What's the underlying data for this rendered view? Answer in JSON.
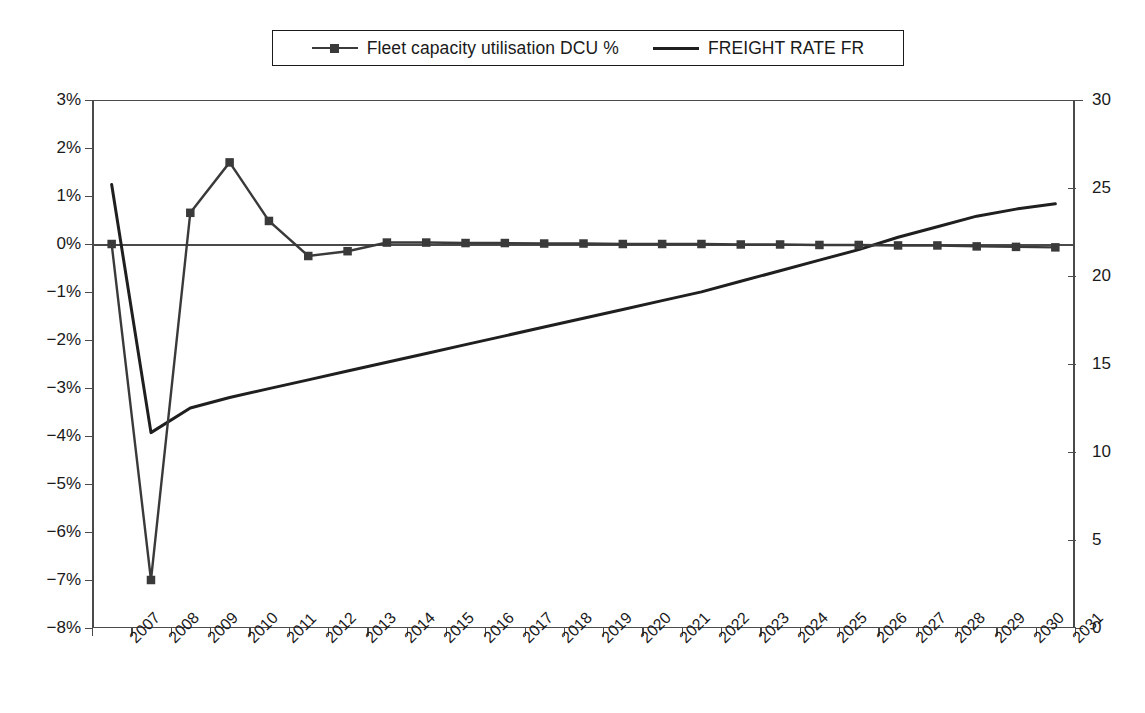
{
  "legend": {
    "items": [
      {
        "label": "Fleet capacity utilisation DCU %",
        "marker": "line-with-square-marker",
        "color": "#3a3a3a"
      },
      {
        "label": "FREIGHT RATE FR",
        "marker": "plain-line",
        "color": "#1f1f1f"
      }
    ]
  },
  "chart_data": {
    "type": "line",
    "title": "",
    "xlabel": "",
    "ylabel": "",
    "grid": false,
    "legend_position": "top-center",
    "categories": [
      "2007",
      "2008",
      "2009",
      "2010",
      "2011",
      "2012",
      "2013",
      "2014",
      "2015",
      "2016",
      "2017",
      "2018",
      "2019",
      "2020",
      "2021",
      "2022",
      "2023",
      "2024",
      "2025",
      "2026",
      "2027",
      "2028",
      "2029",
      "2030",
      "2031"
    ],
    "axes": {
      "left": {
        "label": "Fleet capacity utilisation DCU %",
        "ticks": [
          "3%",
          "2%",
          "1%",
          "0%",
          "-1%",
          "-2%",
          "-3%",
          "-4%",
          "-5%",
          "-6%",
          "-7%",
          "-8%"
        ],
        "tick_values": [
          3,
          2,
          1,
          0,
          -1,
          -2,
          -3,
          -4,
          -5,
          -6,
          -7,
          -8
        ],
        "ylim": [
          -8,
          3
        ],
        "unit": "%"
      },
      "right": {
        "label": "FREIGHT RATE FR",
        "ticks": [
          "30",
          "25",
          "20",
          "15",
          "10",
          "5",
          "0"
        ],
        "tick_values": [
          30,
          25,
          20,
          15,
          10,
          5,
          0
        ],
        "ylim": [
          0,
          30
        ],
        "unit": ""
      }
    },
    "series": [
      {
        "name": "Fleet capacity utilisation DCU %",
        "axis": "left",
        "color": "#3a3a3a",
        "markers": true,
        "values": [
          0.0,
          -7.0,
          0.65,
          1.7,
          0.48,
          -0.25,
          -0.15,
          0.03,
          0.03,
          0.02,
          0.02,
          0.01,
          0.01,
          0.0,
          0.0,
          0.0,
          -0.01,
          -0.01,
          -0.02,
          -0.02,
          -0.03,
          -0.03,
          -0.05,
          -0.06,
          -0.07
        ]
      },
      {
        "name": "FREIGHT RATE FR",
        "axis": "right",
        "color": "#1f1f1f",
        "markers": false,
        "values": [
          25.2,
          11.1,
          12.5,
          13.1,
          13.6,
          14.1,
          14.6,
          15.1,
          15.6,
          16.1,
          16.6,
          17.1,
          17.6,
          18.1,
          18.6,
          19.1,
          19.7,
          20.3,
          20.9,
          21.5,
          22.2,
          22.8,
          23.4,
          23.8,
          24.1
        ]
      }
    ]
  }
}
